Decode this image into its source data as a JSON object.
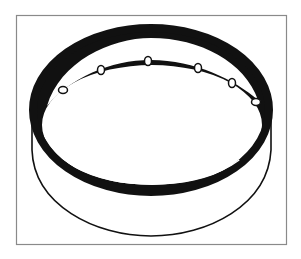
{
  "image": {
    "kind": "line-art illustration",
    "subject": "ring-cylinder-with-perforated-inner-flange",
    "background_color": "#ffffff",
    "ink_color": "#111111",
    "frame_color": "#8a8a8a"
  },
  "frame": {
    "x": 16,
    "y": 15,
    "width": 270,
    "height": 229
  },
  "ring": {
    "outer_ellipse": {
      "cx": 151,
      "cy": 110,
      "rx": 118,
      "ry": 82,
      "stroke_width": 8
    },
    "flange_inner_edge": {
      "cx": 152,
      "cy": 125,
      "rx": 110,
      "ry": 60
    },
    "highlight_edge": {
      "cx": 152,
      "cy": 127,
      "rx": 108,
      "ry": 58
    },
    "cylinder_bottom": {
      "cx": 151,
      "cy": 160,
      "rx": 119,
      "ry": 76
    },
    "holes": [
      {
        "x": 63,
        "y": 90
      },
      {
        "x": 101,
        "y": 70
      },
      {
        "x": 148,
        "y": 61
      },
      {
        "x": 198,
        "y": 68
      },
      {
        "x": 232,
        "y": 83
      },
      {
        "x": 256,
        "y": 102
      }
    ]
  }
}
